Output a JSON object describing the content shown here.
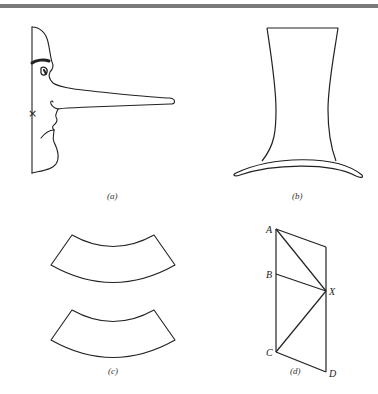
{
  "figure": {
    "panels": [
      {
        "id": "a",
        "caption": "(a)",
        "description": "Profile face with long nose and X mark"
      },
      {
        "id": "b",
        "caption": "(b)",
        "description": "Top hat: crown height vs brim width illusion"
      },
      {
        "id": "c",
        "caption": "(c)",
        "description": "Two identical curved annular segments (Jastrow illusion)"
      },
      {
        "id": "d",
        "caption": "(d)",
        "description": "Parallelogram with diagonals from X"
      }
    ],
    "panel_d_points": {
      "A": "A",
      "B": "B",
      "C": "C",
      "D": "D",
      "X": "X"
    },
    "x_mark": "×"
  },
  "colors": {
    "stroke": "#222222",
    "topbar": "#7a7a7a",
    "background": "#ffffff"
  }
}
